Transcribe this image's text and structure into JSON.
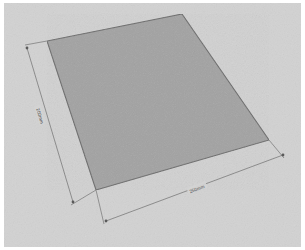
{
  "document": {
    "kind": "technical-drawing",
    "description": "Isometric sketch of a rectangular flat panel with two linear dimensions"
  },
  "colors": {
    "page_border": "#ffffff",
    "paper_background": "#d2d2d2",
    "panel_fill": "#a2a2a2",
    "panel_stroke": "#6b6b6b",
    "dimension_line": "#6e6e6e",
    "dimension_text": "#4a4a4a"
  },
  "shape": {
    "name": "panel",
    "vertices": [
      {
        "id": "top",
        "x": 182,
        "y": 14
      },
      {
        "id": "right",
        "x": 269,
        "y": 140
      },
      {
        "id": "bottom",
        "x": 96,
        "y": 190
      },
      {
        "id": "left",
        "x": 47,
        "y": 41
      }
    ]
  },
  "dimensions": [
    {
      "id": "height-dimension",
      "label": "200mm",
      "edge": "left",
      "start": {
        "x": 27,
        "y": 48
      },
      "end": {
        "x": 73,
        "y": 202
      },
      "label_position": {
        "x": 40,
        "y": 116
      }
    },
    {
      "id": "width-dimension",
      "label": "250mm",
      "edge": "bottom",
      "start": {
        "x": 106,
        "y": 221
      },
      "end": {
        "x": 283,
        "y": 155
      },
      "label_position": {
        "x": 197,
        "y": 189
      }
    }
  ]
}
